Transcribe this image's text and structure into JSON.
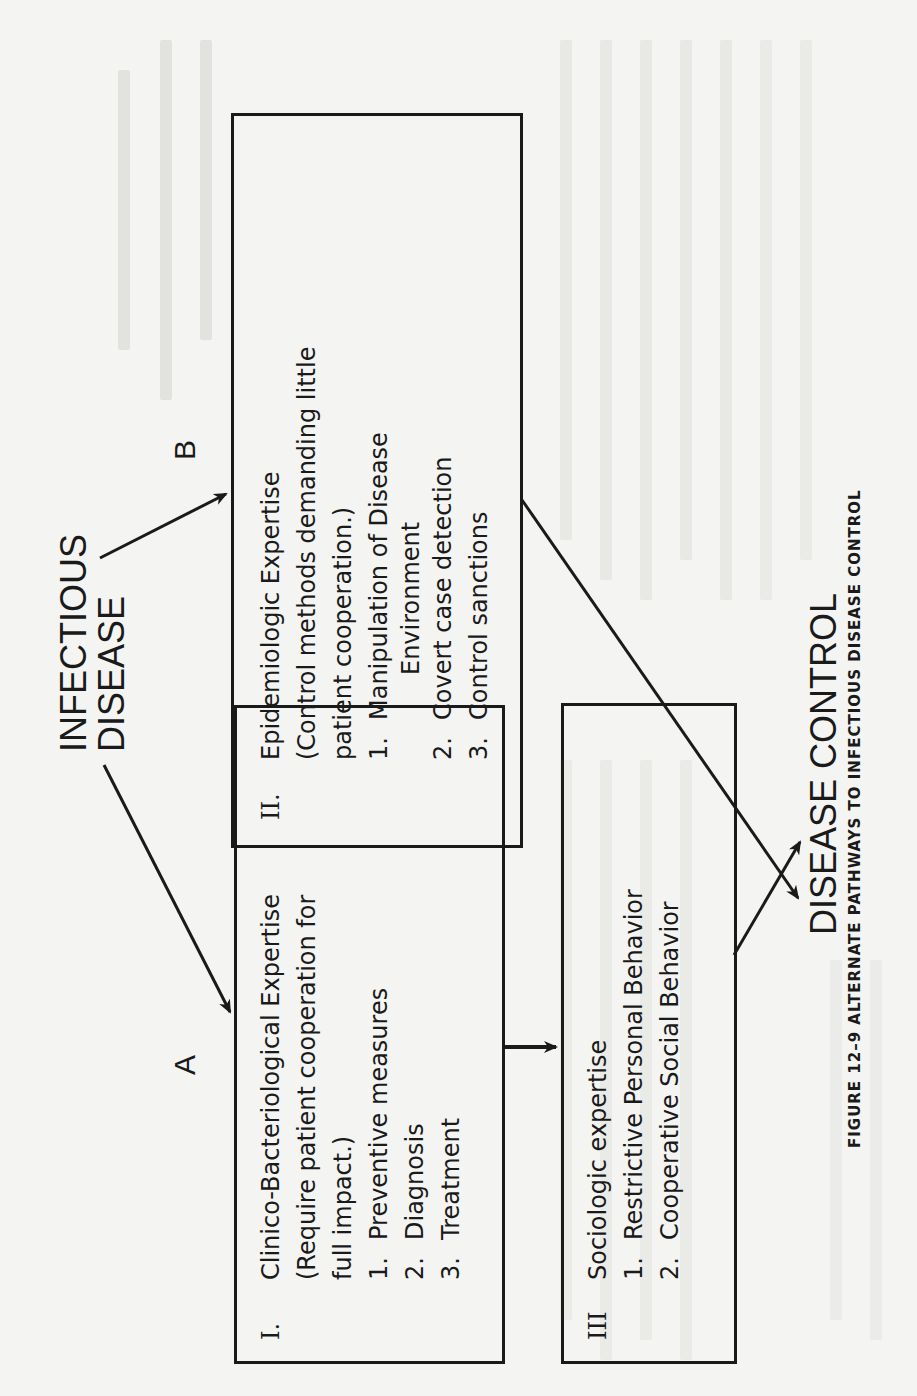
{
  "figure": {
    "source_label": "INFECTIOUS DISEASE",
    "source_lines": [
      "INFECTIOUS",
      "DISEASE"
    ],
    "target_label": "DISEASE CONTROL",
    "path_labels": {
      "a": "A",
      "b": "B"
    },
    "caption": "FIGURE 12–9  ALTERNATE PATHWAYS TO INFECTIOUS DISEASE CONTROL",
    "boxes": {
      "one": {
        "numeral": "I.",
        "lines": [
          "Clinico-Bacteriological Expertise",
          "(Require patient cooperation for",
          "full impact.)"
        ],
        "items": [
          {
            "num": "1.",
            "text": "Preventive measures"
          },
          {
            "num": "2.",
            "text": "Diagnosis"
          },
          {
            "num": "3.",
            "text": "Treatment"
          }
        ]
      },
      "two": {
        "numeral": "II.",
        "lines": [
          "Epidemiologic Expertise",
          "(Control methods demanding little",
          "patient cooperation.)"
        ],
        "items": [
          {
            "num": "1.",
            "text": "Manipulation of Disease",
            "cont": "Environment"
          },
          {
            "num": "2.",
            "text": "Covert case detection"
          },
          {
            "num": "3.",
            "text": "Control sanctions"
          }
        ]
      },
      "three": {
        "numeral": "III",
        "lines": [
          "Sociologic expertise"
        ],
        "items": [
          {
            "num": "1.",
            "text": "Restrictive Personal Behavior"
          },
          {
            "num": "2.",
            "text": "Cooperative Social Behavior"
          }
        ]
      }
    }
  }
}
